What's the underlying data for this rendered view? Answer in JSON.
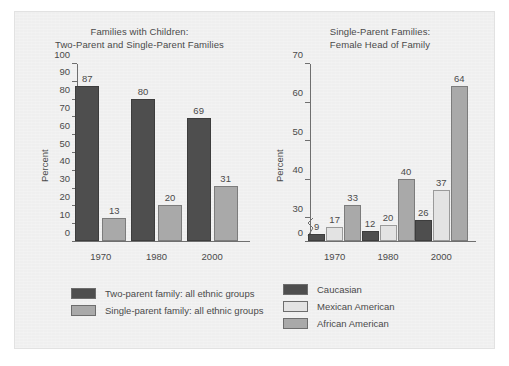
{
  "figure": {
    "background": "#efefef",
    "colors": {
      "dark": "#4e4e4e",
      "light": "#e3e3e3",
      "mid": "#a9a9a9",
      "axis": "#6f6f6f",
      "text": "#4a4a4a"
    }
  },
  "chart_data": [
    {
      "id": "families-with-children",
      "type": "bar",
      "title": "Families with Children:\nTwo-Parent and Single-Parent Families",
      "title_line1": "Families with Children:",
      "title_line2": "Two-Parent and Single-Parent Families",
      "xlabel": "",
      "ylabel": "Percent",
      "categories": [
        "1970",
        "1980",
        "2000"
      ],
      "ylim": [
        0,
        100
      ],
      "yticks": [
        0,
        10,
        20,
        30,
        40,
        50,
        60,
        70,
        80,
        90,
        100
      ],
      "ytick_labels": [
        "0",
        "10",
        "20",
        "30",
        "40",
        "50",
        "60",
        "70",
        "80",
        "90",
        "100"
      ],
      "axis_break": false,
      "grid": false,
      "legend_position": "bottom-left",
      "series": [
        {
          "name": "Two-parent family: all ethnic groups",
          "color": "#4e4e4e",
          "values": [
            87,
            80,
            69
          ]
        },
        {
          "name": "Single-parent family: all ethnic groups",
          "color": "#a9a9a9",
          "values": [
            13,
            20,
            31
          ]
        }
      ]
    },
    {
      "id": "single-parent-female-head",
      "type": "bar",
      "title": "Single-Parent Families:\nFemale Head of Family",
      "title_line1": "Single-Parent Families:",
      "title_line2": "Female Head of Family",
      "xlabel": "",
      "ylabel": "Percent",
      "categories": [
        "1970",
        "1980",
        "2000"
      ],
      "ylim": [
        0,
        70
      ],
      "yticks": [
        0,
        30,
        40,
        50,
        60,
        70
      ],
      "ytick_labels": [
        "0",
        "30",
        "40",
        "50",
        "60",
        "70"
      ],
      "axis_break": true,
      "axis_break_between": [
        0,
        30
      ],
      "grid": false,
      "legend_position": "bottom-center",
      "series": [
        {
          "name": "Caucasian",
          "color": "#4e4e4e",
          "values": [
            9,
            12,
            26
          ]
        },
        {
          "name": "Mexican American",
          "color": "#e3e3e3",
          "values": [
            17,
            20,
            37
          ]
        },
        {
          "name": "African American",
          "color": "#a9a9a9",
          "values": [
            33,
            40,
            64
          ]
        }
      ]
    }
  ]
}
